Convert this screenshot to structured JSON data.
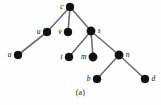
{
  "figure": {
    "caption": "(a)",
    "width": 161,
    "height": 105,
    "background_color": "#fefefe",
    "node_color": "#111111",
    "edge_color": "#6e6e6e"
  },
  "chart_data": {
    "type": "diagram",
    "diagram_kind": "rooted-tree",
    "title": "(a)",
    "nodes": [
      {
        "id": "c",
        "label": "c",
        "x": 70,
        "y": 7,
        "r": 4.0,
        "label_side": "left",
        "depth": 0
      },
      {
        "id": "u",
        "label": "u",
        "x": 47,
        "y": 32,
        "r": 4.0,
        "label_side": "left",
        "depth": 1
      },
      {
        "id": "v",
        "label": "v",
        "x": 68,
        "y": 32,
        "r": 4.0,
        "label_side": "left",
        "depth": 1
      },
      {
        "id": "s",
        "label": "s",
        "x": 91,
        "y": 31,
        "r": 4.2,
        "label_side": "right",
        "depth": 1
      },
      {
        "id": "a",
        "label": "a",
        "x": 18,
        "y": 55,
        "r": 4.0,
        "label_side": "left",
        "depth": 2
      },
      {
        "id": "t",
        "label": "t",
        "x": 69,
        "y": 57,
        "r": 4.0,
        "label_side": "left",
        "depth": 2
      },
      {
        "id": "m",
        "label": "m",
        "x": 93,
        "y": 57,
        "r": 4.2,
        "label_side": "left",
        "depth": 2
      },
      {
        "id": "n",
        "label": "n",
        "x": 119,
        "y": 55,
        "r": 4.2,
        "label_side": "right",
        "depth": 2
      },
      {
        "id": "b",
        "label": "b",
        "x": 97,
        "y": 79,
        "r": 4.0,
        "label_side": "left",
        "depth": 3
      },
      {
        "id": "d",
        "label": "d",
        "x": 145,
        "y": 79,
        "r": 4.0,
        "label_side": "right",
        "depth": 3
      }
    ],
    "edges": [
      {
        "from": "c",
        "to": "u"
      },
      {
        "from": "c",
        "to": "v"
      },
      {
        "from": "c",
        "to": "s"
      },
      {
        "from": "u",
        "to": "a"
      },
      {
        "from": "s",
        "to": "t"
      },
      {
        "from": "s",
        "to": "m"
      },
      {
        "from": "s",
        "to": "n"
      },
      {
        "from": "n",
        "to": "b"
      },
      {
        "from": "n",
        "to": "d"
      }
    ]
  }
}
